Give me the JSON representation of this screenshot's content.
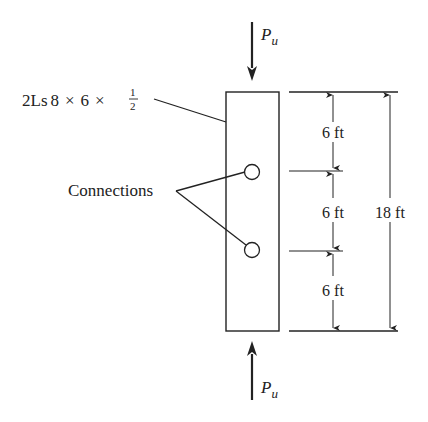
{
  "diagram": {
    "member_label": {
      "prefix": "2Ls",
      "dim1": "8",
      "times": "×",
      "dim2": "6",
      "frac_num": "1",
      "frac_den": "2"
    },
    "connections_label": "Connections",
    "load_top": {
      "symbol": "P",
      "subscript": "u"
    },
    "load_bottom": {
      "symbol": "P",
      "subscript": "u"
    },
    "segment_dims": [
      "6 ft",
      "6 ft",
      "6 ft"
    ],
    "total_dim": "18 ft",
    "colors": {
      "stroke": "#222222",
      "background": "#ffffff"
    }
  }
}
